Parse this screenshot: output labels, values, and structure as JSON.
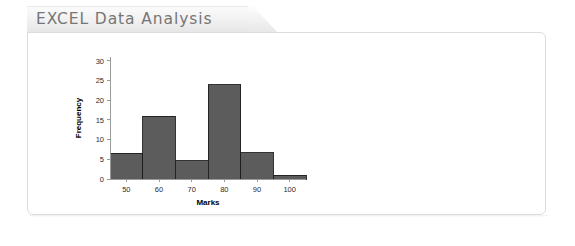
{
  "header": {
    "title": "EXCEL Data Analysis"
  },
  "panel": {
    "background_color": "#ffffff",
    "border_color": "#dcdcdc"
  },
  "chart_data": {
    "type": "bar",
    "subtype": "histogram",
    "title": "",
    "xlabel": "Marks",
    "ylabel": "Frequency",
    "categories": [
      "50",
      "60",
      "70",
      "80",
      "90",
      "100"
    ],
    "bin_centers": [
      50,
      60,
      70,
      80,
      90,
      100
    ],
    "bin_width": 10,
    "values": [
      6.6,
      16,
      4.7,
      24,
      6.7,
      1
    ],
    "xlim": [
      45,
      105
    ],
    "ylim": [
      0,
      31
    ],
    "xticks": [
      50,
      60,
      70,
      80,
      90,
      100
    ],
    "yticks": [
      0,
      5,
      10,
      15,
      20,
      25,
      30
    ],
    "grid": false,
    "legend": false,
    "bar_fill_color": "#5c5c5c",
    "bar_edge_color": "#1d1d1d",
    "axis_color": "#9a9a9a"
  }
}
